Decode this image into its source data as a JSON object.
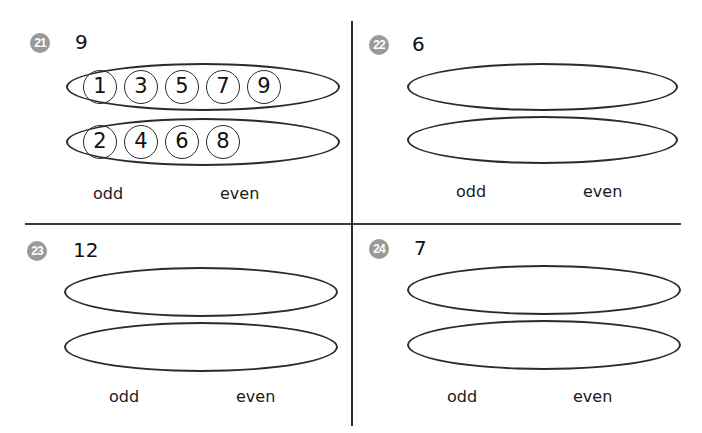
{
  "worksheet": {
    "problems": [
      {
        "badge": "21",
        "number": "9",
        "odd_group": [
          "1",
          "3",
          "5",
          "7",
          "9"
        ],
        "even_group": [
          "2",
          "4",
          "6",
          "8"
        ],
        "odd_label": "odd",
        "even_label": "even"
      },
      {
        "badge": "22",
        "number": "6",
        "odd_group": [],
        "even_group": [],
        "odd_label": "odd",
        "even_label": "even"
      },
      {
        "badge": "23",
        "number": "12",
        "odd_group": [],
        "even_group": [],
        "odd_label": "odd",
        "even_label": "even"
      },
      {
        "badge": "24",
        "number": "7",
        "odd_group": [],
        "even_group": [],
        "odd_label": "odd",
        "even_label": "even"
      }
    ]
  }
}
